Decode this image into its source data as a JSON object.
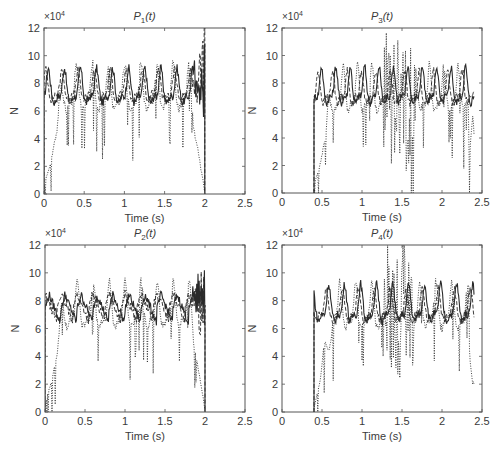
{
  "chart_data": [
    {
      "type": "line",
      "id": "p1",
      "title": "P1(t)",
      "title_main": "P",
      "title_sub": "1",
      "title_tail": "(t)",
      "xlabel": "Time (s)",
      "ylabel": "N",
      "y_multiplier": "×10",
      "y_multiplier_exp": "4",
      "xlim": [
        0,
        2.5
      ],
      "ylim": [
        0,
        12
      ],
      "xticks": [
        0,
        0.5,
        1,
        1.5,
        2,
        2.5
      ],
      "xtick_labels": [
        "0",
        "0.5",
        "1",
        "1.5",
        "2",
        "2.5"
      ],
      "yticks": [
        0,
        2,
        4,
        6,
        8,
        10,
        12
      ],
      "ytick_labels": [
        "0",
        "2",
        "4",
        "6",
        "8",
        "10",
        "12"
      ],
      "start_time": 0.0,
      "end_time": 2.0,
      "end_behavior": "drop_to_zero",
      "series": [
        {
          "name": "solid",
          "style": "solid",
          "mean": 7.5,
          "amp": 1.5,
          "period": 0.2,
          "phase": 0.05
        },
        {
          "name": "dashed",
          "style": "dashed",
          "mean": 7.6,
          "amp": 1.3,
          "period": 0.2,
          "phase": 0.08
        },
        {
          "name": "dotted",
          "style": "dotted",
          "mean": 7.3,
          "amp": 2.0,
          "period": 0.2,
          "phase": 0.1,
          "ramp_up": true
        }
      ],
      "annotations": "Oscillating force around 7.5e4 N with peaks ~9e4, troughs ~6e4; dotted series dips as low as ~3.5e4 near t≈0.95 s; large spikes up to 12e4 near t=2 s before drop to 0."
    },
    {
      "type": "line",
      "id": "p3",
      "title": "P3(t)",
      "title_main": "P",
      "title_sub": "3",
      "title_tail": "(t)",
      "xlabel": "Time (s)",
      "ylabel": "N",
      "y_multiplier": "×10",
      "y_multiplier_exp": "4",
      "xlim": [
        0,
        2.5
      ],
      "ylim": [
        0,
        12
      ],
      "xticks": [
        0,
        0.5,
        1,
        1.5,
        2,
        2.5
      ],
      "xtick_labels": [
        "0",
        "0.5",
        "1",
        "1.5",
        "2",
        "2.5"
      ],
      "yticks": [
        0,
        2,
        4,
        6,
        8,
        10,
        12
      ],
      "ytick_labels": [
        "0",
        "2",
        "4",
        "6",
        "8",
        "10",
        "12"
      ],
      "start_time": 0.4,
      "end_time": 2.4,
      "end_behavior": "hold",
      "series": [
        {
          "name": "solid",
          "style": "solid",
          "mean": 7.5,
          "amp": 1.6,
          "period": 0.18,
          "phase": 0.0
        },
        {
          "name": "dashed",
          "style": "dashed",
          "mean": 7.4,
          "amp": 1.4,
          "period": 0.18,
          "phase": 0.04
        },
        {
          "name": "dotted",
          "style": "dotted",
          "mean": 7.2,
          "amp": 2.0,
          "period": 0.18,
          "phase": 0.09,
          "ramp_up": true
        }
      ],
      "annotations": "Starts at t≈0.4 s; dotted series spikes to 12e4 and dips to ~1.3e4 around t≈1.3–1.5 s; final dotted dip to ~2.7e4 at t≈2.4 s."
    },
    {
      "type": "line",
      "id": "p2",
      "title": "P2(t)",
      "title_main": "P",
      "title_sub": "2",
      "title_tail": "(t)",
      "xlabel": "Time (s)",
      "ylabel": "N",
      "y_multiplier": "×10",
      "y_multiplier_exp": "4",
      "xlim": [
        0,
        2.5
      ],
      "ylim": [
        0,
        12
      ],
      "xticks": [
        0,
        0.5,
        1,
        1.5,
        2,
        2.5
      ],
      "xtick_labels": [
        "0",
        "0.5",
        "1",
        "1.5",
        "2",
        "2.5"
      ],
      "yticks": [
        0,
        2,
        4,
        6,
        8,
        10,
        12
      ],
      "ytick_labels": [
        "0",
        "2",
        "4",
        "6",
        "8",
        "10",
        "12"
      ],
      "start_time": 0.0,
      "end_time": 2.0,
      "end_behavior": "drop_to_zero",
      "series": [
        {
          "name": "solid",
          "style": "solid",
          "mean": 7.4,
          "amp": 1.4,
          "period": 0.2,
          "phase": 0.0,
          "sawtooth": true
        },
        {
          "name": "dashed",
          "style": "dashed",
          "mean": 7.5,
          "amp": 1.3,
          "period": 0.2,
          "phase": 0.05,
          "sawtooth": true
        },
        {
          "name": "dotted",
          "style": "dotted",
          "mean": 7.3,
          "amp": 2.0,
          "period": 0.2,
          "phase": 0.1,
          "ramp_up": true
        }
      ],
      "annotations": "Sawtooth-like oscillation between ~6e4 and ~9e4; dotted dips to ~3.7e4 near t≈0.95 s; peaks to 12e4 near t=2 s before drop to 0."
    },
    {
      "type": "line",
      "id": "p4",
      "title": "P4(t)",
      "title_main": "P",
      "title_sub": "4",
      "title_tail": "(t)",
      "xlabel": "Time (s)",
      "ylabel": "N",
      "y_multiplier": "×10",
      "y_multiplier_exp": "4",
      "xlim": [
        0,
        2.5
      ],
      "ylim": [
        0,
        12
      ],
      "xticks": [
        0,
        0.5,
        1,
        1.5,
        2,
        2.5
      ],
      "xtick_labels": [
        "0",
        "0.5",
        "1",
        "1.5",
        "2",
        "2.5"
      ],
      "yticks": [
        0,
        2,
        4,
        6,
        8,
        10,
        12
      ],
      "ytick_labels": [
        "0",
        "2",
        "4",
        "6",
        "8",
        "10",
        "12"
      ],
      "start_time": 0.4,
      "end_time": 2.4,
      "end_behavior": "hold",
      "series": [
        {
          "name": "solid",
          "style": "solid",
          "mean": 7.5,
          "amp": 1.6,
          "period": 0.2,
          "phase": 0.12
        },
        {
          "name": "dashed",
          "style": "dashed",
          "mean": 7.4,
          "amp": 1.4,
          "period": 0.2,
          "phase": 0.15
        },
        {
          "name": "dotted",
          "style": "dotted",
          "mean": 7.2,
          "amp": 2.0,
          "period": 0.2,
          "phase": 0.18,
          "ramp_up": true
        }
      ],
      "annotations": "Starts at t≈0.4 s; dotted spikes to 12e4 and dips to ~0.3e4 around t≈1.4 s; final dotted dip to ~2.7e4 at t≈2.4 s."
    }
  ],
  "layout": {
    "panels": [
      {
        "id": "p1",
        "box": [
          44,
          28,
          245,
          194
        ]
      },
      {
        "id": "p3",
        "box": [
          282,
          28,
          482,
          193
        ]
      },
      {
        "id": "p2",
        "box": [
          45,
          245,
          245,
          412
        ]
      },
      {
        "id": "p4",
        "box": [
          282,
          245,
          482,
          412
        ]
      }
    ],
    "line_color": "#2a2a2a",
    "axis_color": "#555555"
  }
}
